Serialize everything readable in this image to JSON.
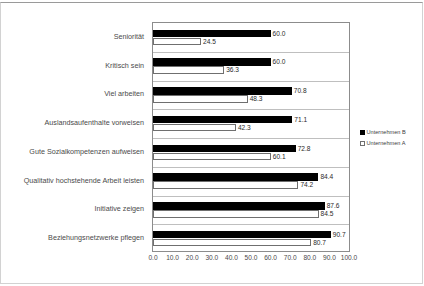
{
  "chart_data": {
    "type": "bar",
    "orientation": "horizontal",
    "title": "",
    "xlabel": "",
    "ylabel": "",
    "xlim": [
      0,
      100
    ],
    "xticks": [
      "0.0",
      "10.0",
      "20.0",
      "30.0",
      "40.0",
      "50.0",
      "60.0",
      "70.0",
      "80.0",
      "90.0",
      "100.0"
    ],
    "grid": false,
    "legend_position": "right",
    "categories": [
      "Seniorität",
      "Kritisch sein",
      "Viel arbeiten",
      "Auslandsaufenthalte vorweisen",
      "Gute Sozialkompetenzen aufweisen",
      "Qualitativ hochstehende Arbeit leisten",
      "Initiative zeigen",
      "Beziehungsnetzwerke pflegen"
    ],
    "series": [
      {
        "name": "Unternehmen B",
        "swatch": "filled-square",
        "color": "#000000",
        "values": [
          60.0,
          60.0,
          70.8,
          71.1,
          72.8,
          84.4,
          87.6,
          90.7
        ],
        "labels": [
          "60.0",
          "60.0",
          "70.8",
          "71.1",
          "72.8",
          "84.4",
          "87.6",
          "90.7"
        ]
      },
      {
        "name": "Unternehmen A",
        "swatch": "hollow-square",
        "color": "#ffffff",
        "values": [
          24.5,
          36.3,
          48.3,
          42.3,
          60.1,
          74.2,
          84.5,
          80.7
        ],
        "labels": [
          "24.5",
          "36.3",
          "48.3",
          "42.3",
          "60.1",
          "74.2",
          "84.5",
          "80.7"
        ]
      }
    ]
  },
  "legend": {
    "entries": [
      {
        "label": "Unternehmen B"
      },
      {
        "label": "Unternehmen A"
      }
    ]
  }
}
